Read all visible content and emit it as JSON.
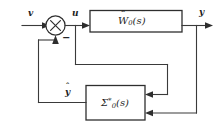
{
  "diagram": {
    "type": "control-system-block-diagram",
    "background_color": "#ffffff",
    "line_color": "#3a3a3a",
    "text_color": "#1d1d1d",
    "signals": {
      "input": "v",
      "control": "u",
      "output": "y",
      "feedback": "ŷ",
      "feedback_base": "y",
      "feedback_accent": "ˆ"
    },
    "summing_junction": {
      "name": "summing-junction",
      "symbol": "×",
      "sign_label": "−"
    },
    "blocks": [
      {
        "id": "plant",
        "base": "W",
        "accent": "ˆ",
        "subscript": "0",
        "superscript": "",
        "argument": "(s)",
        "label_plain": "Ŵ₀(s)"
      },
      {
        "id": "observer",
        "base": "Σ",
        "accent": "",
        "subscript": "0",
        "superscript": "*",
        "argument": "(s)",
        "label_plain": "Σ₀*(s)"
      }
    ]
  }
}
